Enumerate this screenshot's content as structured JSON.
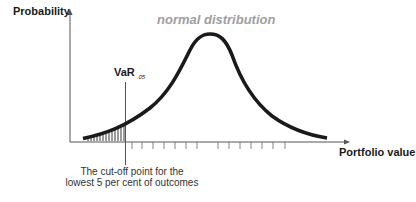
{
  "diagram": {
    "title": "normal distribution",
    "y_axis_label": "Probability",
    "x_axis_label": "Portfolio value",
    "var_label": "VaR",
    "var_subscript": ".05",
    "caption_line1": "The cut-off point for the",
    "caption_line2": "lowest 5 per cent of outcomes",
    "colors": {
      "curve": "#1a1a1a",
      "axis": "#555555",
      "title": "#a0a0a0",
      "hatch": "#222222"
    },
    "tick_count": 14,
    "shaded_region": "left tail below VaR cut-off (5%)"
  }
}
